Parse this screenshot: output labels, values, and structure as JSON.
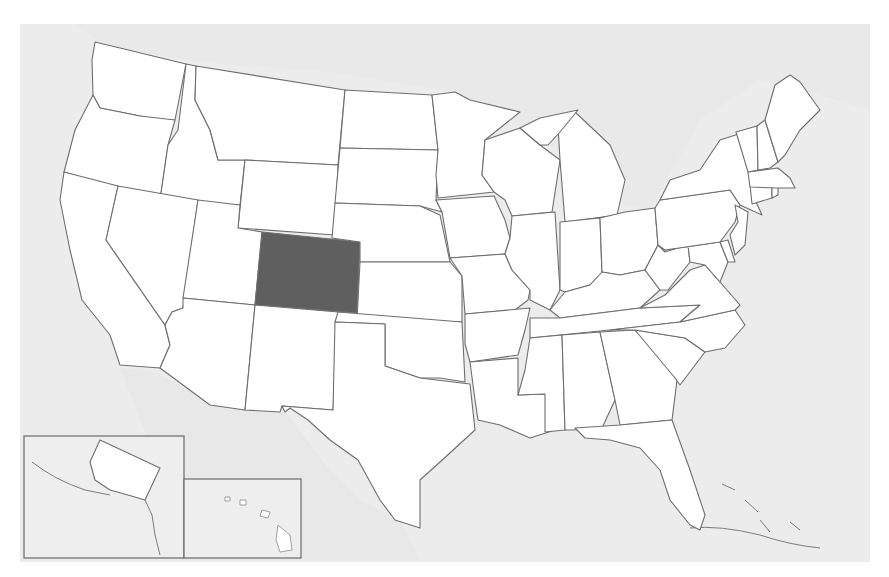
{
  "map": {
    "title": "",
    "subject": "United States",
    "highlighted_state": "Colorado",
    "colors": {
      "ocean": "#ececec",
      "state_fill": "#ffffff",
      "state_border": "#6e6e6e",
      "highlight_fill": "#5f5f5f"
    },
    "insets": [
      {
        "label": "Alaska"
      },
      {
        "label": "Hawaii"
      }
    ],
    "states": [
      "Washington",
      "Oregon",
      "California",
      "Idaho",
      "Nevada",
      "Montana",
      "Wyoming",
      "Utah",
      "Arizona",
      "Colorado",
      "New Mexico",
      "North Dakota",
      "South Dakota",
      "Nebraska",
      "Kansas",
      "Oklahoma",
      "Texas",
      "Minnesota",
      "Iowa",
      "Missouri",
      "Arkansas",
      "Louisiana",
      "Wisconsin",
      "Illinois",
      "Michigan",
      "Indiana",
      "Ohio",
      "Kentucky",
      "Tennessee",
      "Mississippi",
      "Alabama",
      "Georgia",
      "Florida",
      "South Carolina",
      "North Carolina",
      "Virginia",
      "West Virginia",
      "Maryland",
      "Delaware",
      "Pennsylvania",
      "New Jersey",
      "New York",
      "Connecticut",
      "Rhode Island",
      "Massachusetts",
      "Vermont",
      "New Hampshire",
      "Maine",
      "Alaska",
      "Hawaii"
    ]
  }
}
